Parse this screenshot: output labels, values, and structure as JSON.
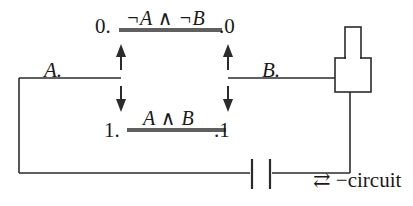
{
  "figure": {
    "stroke_color": "#2b2b2b",
    "text_color": "#1a1a1a",
    "background": "#ffffff"
  },
  "labels": {
    "top_left_state": "0.",
    "top_right_state": ".0",
    "top_expression": "¬A ∧ ¬B",
    "bottom_left_state": "1.",
    "bottom_right_state": ".1",
    "bottom_expression": "A ∧ B",
    "switch_a": "A.",
    "switch_b": "B.",
    "circuit_caption": "⇄ −circuit"
  },
  "components": {
    "lamp": "lamp-symbol",
    "battery": "battery-symbol",
    "switch_left": "switch-left-arrows",
    "switch_right": "switch-right-arrows"
  }
}
